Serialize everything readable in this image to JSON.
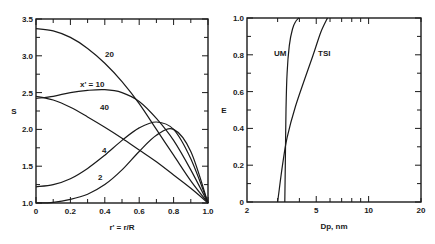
{
  "chart_data": [
    {
      "type": "line",
      "title": "",
      "xlabel": "r' = r/R",
      "ylabel": "S",
      "xlim": [
        0,
        1.0
      ],
      "ylim": [
        1.0,
        3.5
      ],
      "xticks": [
        "0",
        "0.2",
        "0.4",
        "0.6",
        "0.8",
        "1.0"
      ],
      "yticks": [
        "1.0",
        "1.5",
        "2.0",
        "2.5",
        "3.0",
        "3.5"
      ],
      "grid": false,
      "legend": "inline curve labels",
      "series": [
        {
          "name": "2",
          "label": "2",
          "x": [
            0,
            0.1,
            0.2,
            0.3,
            0.4,
            0.5,
            0.6,
            0.7,
            0.8,
            0.9,
            1.0
          ],
          "y": [
            1.0,
            1.01,
            1.05,
            1.12,
            1.25,
            1.45,
            1.7,
            1.92,
            2.0,
            1.7,
            1.0
          ]
        },
        {
          "name": "4",
          "label": "4",
          "x": [
            0,
            0.1,
            0.2,
            0.3,
            0.4,
            0.5,
            0.6,
            0.7,
            0.8,
            0.9,
            1.0
          ],
          "y": [
            1.22,
            1.25,
            1.33,
            1.47,
            1.65,
            1.85,
            2.02,
            2.1,
            2.0,
            1.6,
            1.0
          ]
        },
        {
          "name": "10",
          "label": "x' = 10",
          "x": [
            0,
            0.1,
            0.2,
            0.3,
            0.4,
            0.5,
            0.6,
            0.7,
            0.8,
            0.9,
            1.0
          ],
          "y": [
            2.42,
            2.45,
            2.5,
            2.53,
            2.54,
            2.5,
            2.38,
            2.15,
            1.85,
            1.45,
            1.0
          ]
        },
        {
          "name": "20",
          "label": "20",
          "x": [
            0,
            0.1,
            0.2,
            0.3,
            0.4,
            0.5,
            0.6,
            0.7,
            0.8,
            0.9,
            1.0
          ],
          "y": [
            3.37,
            3.34,
            3.25,
            3.1,
            2.9,
            2.65,
            2.35,
            2.0,
            1.65,
            1.3,
            1.0
          ]
        },
        {
          "name": "40",
          "label": "40",
          "x": [
            0,
            0.1,
            0.2,
            0.3,
            0.4,
            0.5,
            0.6,
            0.7,
            0.8,
            0.9,
            1.0
          ],
          "y": [
            2.45,
            2.4,
            2.3,
            2.17,
            2.03,
            1.88,
            1.72,
            1.56,
            1.38,
            1.2,
            1.0
          ]
        }
      ]
    },
    {
      "type": "line",
      "title": "",
      "xlabel": "Dp, nm",
      "ylabel": "E",
      "xscale": "log",
      "xlim": [
        2,
        20
      ],
      "ylim": [
        0,
        1.0
      ],
      "xticks": [
        "2",
        "5",
        "10",
        "20"
      ],
      "yticks": [
        "0",
        "0.2",
        "0.4",
        "0.6",
        "0.8",
        "1.0"
      ],
      "grid": false,
      "legend": "inline curve labels",
      "series": [
        {
          "name": "UM",
          "label": "UM",
          "x": [
            3.3,
            3.32,
            3.35,
            3.4,
            3.5,
            3.65,
            3.8,
            3.97
          ],
          "y": [
            0,
            0.2,
            0.5,
            0.7,
            0.85,
            0.94,
            0.98,
            1.0
          ]
        },
        {
          "name": "TSI",
          "label": "TSI",
          "x": [
            3.0,
            3.2,
            3.4,
            3.8,
            4.3,
            4.8,
            5.3,
            5.8
          ],
          "y": [
            0,
            0.2,
            0.35,
            0.52,
            0.67,
            0.8,
            0.92,
            1.0
          ]
        }
      ]
    }
  ],
  "left_chart": {
    "ylabel": "S",
    "xlabel": "r' = r/R",
    "xticks": [
      "0",
      "0.2",
      "0.4",
      "0.6",
      "0.8",
      "1.0"
    ],
    "yticks": [
      "1.0",
      "1.5",
      "2.0",
      "2.5",
      "3.0",
      "3.5"
    ],
    "curve_labels": [
      "20",
      "x' = 10",
      "40",
      "4",
      "2"
    ]
  },
  "right_chart": {
    "ylabel": "E",
    "xlabel": "Dp, nm",
    "xticks": [
      "2",
      "5",
      "10",
      "20"
    ],
    "yticks": [
      "0",
      "0.2",
      "0.4",
      "0.6",
      "0.8",
      "1.0"
    ],
    "curve_labels": [
      "UM",
      "TSI"
    ]
  }
}
